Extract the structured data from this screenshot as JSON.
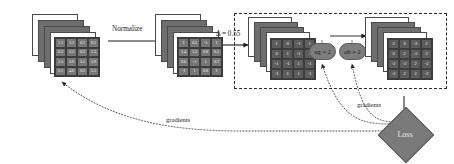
{
  "figure": {
    "canvas": {
      "width": 454,
      "height": 164,
      "background": "#ffffff"
    }
  },
  "labels": {
    "normalize": "Normalize",
    "delta": "Δ = 0.55",
    "gradients_left": "gradients",
    "gradients_right": "gradients",
    "loss": "Loss"
  },
  "nodes": {
    "alpha_g": {
      "symbol": "α",
      "subscript": "g",
      "value": "2",
      "text": "αg = 2"
    },
    "alpha_b": {
      "symbol": "α",
      "subscript": "b",
      "value": "2",
      "text": "αb = 2"
    }
  },
  "colors": {
    "sheet_fill": "#6e6e6e",
    "grid_fill": "#777777",
    "grid_fill_dark": "#5d5d5d",
    "node_fill": "#7d7d7d",
    "diamond_fill": "#7a7a7a",
    "stroke": "#3a3a3a",
    "text_on_dark": "#f2f2f2",
    "text": "#1a1a1a"
  },
  "stacks": [
    {
      "name": "input-feature-maps",
      "sheet_count": 4,
      "grid": {
        "rows": [
          [
            "1.1",
            "1.3",
            "0.1",
            "0.1"
          ],
          [
            "0.2",
            "2.5",
            "0.2",
            "1.5"
          ],
          [
            "1.5",
            "3.9",
            "3.5",
            "2.9"
          ],
          [
            "2.1",
            "4.6",
            "0.2",
            "5.5"
          ]
        ]
      }
    },
    {
      "name": "normalized-feature-maps",
      "sheet_count": 4,
      "grid": {
        "rows": [
          [
            "1",
            "0.2",
            "-1",
            "1"
          ],
          [
            "1.4",
            "1.5",
            "0.8",
            "0.1"
          ],
          [
            "0.6",
            "-1",
            "1",
            "0.7"
          ],
          [
            "-1",
            "1",
            "0.8",
            "1"
          ]
        ]
      }
    },
    {
      "name": "quantized-feature-maps",
      "sheet_count": 4,
      "grid": {
        "rows": [
          [
            "1",
            "0",
            "-1",
            "1"
          ],
          [
            "0",
            "1",
            "-1",
            "1"
          ],
          [
            "-1",
            "-1",
            "1",
            "-1"
          ],
          [
            "-1",
            "1",
            "1",
            "-1"
          ]
        ]
      }
    },
    {
      "name": "scaled-feature-maps",
      "sheet_count": 4,
      "grid": {
        "rows": [
          [
            "2",
            "0",
            "-2",
            "2"
          ],
          [
            "0",
            "2",
            "-2",
            "2"
          ],
          [
            "-2",
            "-2",
            "2",
            "-2"
          ],
          [
            "-2",
            "2",
            "2",
            "-2"
          ]
        ]
      }
    }
  ]
}
